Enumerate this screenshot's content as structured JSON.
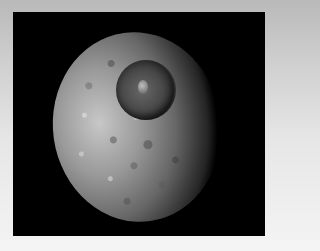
{
  "image": {
    "subject": "Mimas (Saturn moon) with Herschel crater",
    "colors": {
      "background_frame": "#e6e6e6",
      "space": "#000000",
      "moon_highlight": "#d2d2d2",
      "moon_shadow": "#282828"
    }
  }
}
